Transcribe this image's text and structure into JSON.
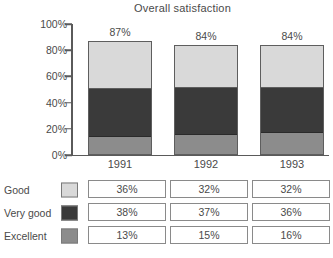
{
  "chart_data": {
    "type": "bar",
    "subtype": "stacked-bar-100",
    "title": "Overall satisfaction",
    "xlabel": "",
    "ylabel": "",
    "categories": [
      "1991",
      "1992",
      "1993"
    ],
    "ylim": [
      0,
      100
    ],
    "yticks": [
      "0%",
      "20%",
      "40%",
      "60%",
      "80%",
      "100%"
    ],
    "ytick_values": [
      0,
      20,
      40,
      60,
      80,
      100
    ],
    "grid": false,
    "legend_position": "bottom-table",
    "series": [
      {
        "name": "Good",
        "color": "#d9d9d9",
        "values": [
          36,
          32,
          32
        ],
        "labels": [
          "36%",
          "32%",
          "32%"
        ]
      },
      {
        "name": "Very good",
        "color": "#3a3a3a",
        "values": [
          38,
          37,
          36
        ],
        "labels": [
          "38%",
          "37%",
          "36%"
        ]
      },
      {
        "name": "Excellent",
        "color": "#8c8c8c",
        "values": [
          13,
          15,
          16
        ],
        "labels": [
          "13%",
          "15%",
          "16%"
        ]
      }
    ],
    "totals": [
      87,
      84,
      84
    ],
    "total_labels": [
      "87%",
      "84%",
      "84%"
    ]
  },
  "colors": {
    "good": "#d9d9d9",
    "very_good": "#3a3a3a",
    "excellent": "#8c8c8c",
    "axis": "#5a5a5a",
    "text": "#4a4a4a",
    "background": "#ffffff"
  }
}
